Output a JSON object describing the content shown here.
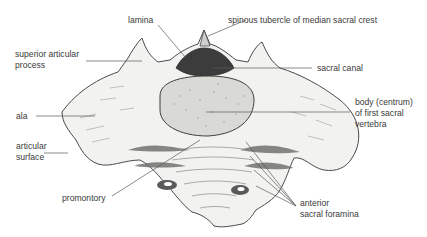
{
  "diagram": {
    "colors": {
      "bone_fill": "#f2f2f0",
      "bone_outline": "#4a4a4a",
      "body_fill": "#d9d9d6",
      "canal_fill": "#3c3c3c",
      "shadow": "#7a7a7a",
      "leader_line": "#5a5a5a",
      "label_text": "#3a3a3a"
    },
    "labels": {
      "lamina": "lamina",
      "spinous_tubercle": "spinous tubercle of median sacral crest",
      "superior_articular_process_1": "superior articular",
      "superior_articular_process_2": "process",
      "sacral_canal": "sacral canal",
      "ala": "ala",
      "body_1": "body (centrum)",
      "body_2": "of first sacral",
      "body_3": "vertebra",
      "articular_surface_1": "articular",
      "articular_surface_2": "surface",
      "promontory": "promontory",
      "anterior_sacral_foramina_1": "anterior",
      "anterior_sacral_foramina_2": "sacral foramina"
    }
  }
}
